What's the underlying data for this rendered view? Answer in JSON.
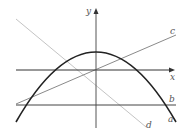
{
  "diagram": {
    "type": "function-graphs",
    "axes": {
      "x_label": "x",
      "y_label": "y",
      "color": "#333333"
    },
    "curves": [
      {
        "id": "a",
        "label": "a",
        "kind": "parabola-downward",
        "color": "#222222"
      },
      {
        "id": "b",
        "label": "b",
        "kind": "horizontal-line",
        "color": "#444444"
      },
      {
        "id": "c",
        "label": "c",
        "kind": "line-positive-slope",
        "color": "#888888"
      },
      {
        "id": "d",
        "label": "d",
        "kind": "line-negative-slope",
        "color": "#bbbbbb"
      }
    ]
  }
}
